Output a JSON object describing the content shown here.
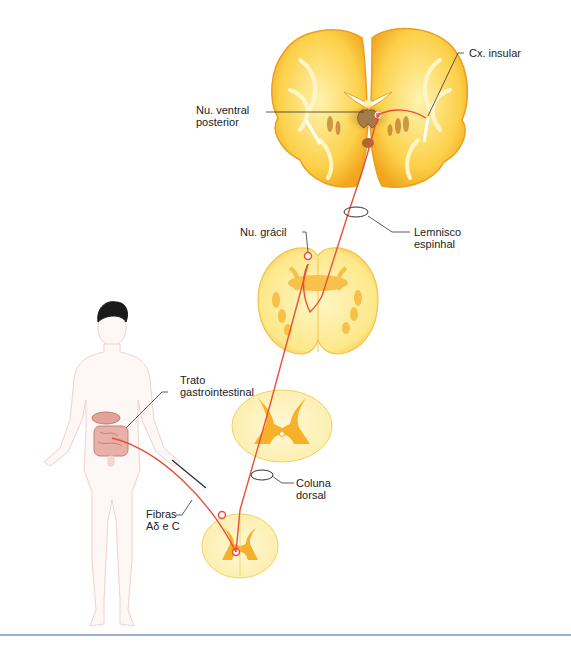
{
  "figure": {
    "colors": {
      "pathway": "#e8503a",
      "tissue_yellow": "#fbd24a",
      "tissue_light": "#fdf2b8",
      "gray_matter": "#f5a623",
      "thalamus_brown": "#a8742e",
      "body_outline": "#f0d0cc",
      "rule": "#9aaed6"
    }
  },
  "labels": {
    "insular_cortex": [
      "Cx. insular"
    ],
    "vpn": [
      "Nu. ventral",
      "posterior"
    ],
    "spinal_lemniscus": [
      "Lemnisco",
      "espinhal"
    ],
    "gracile_nucleus": [
      "Nu. grácil"
    ],
    "gi_tract": [
      "Trato",
      "gastrointestinal"
    ],
    "dorsal_column": [
      "Coluna",
      "dorsal"
    ],
    "fibers": [
      "Fibras",
      "Aδ e C"
    ]
  }
}
